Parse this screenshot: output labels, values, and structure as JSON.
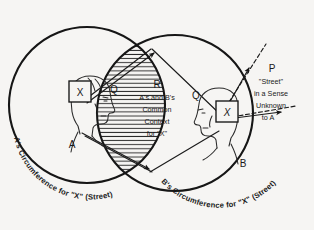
{
  "figure": {
    "background_color": "#f6f5f3",
    "ink_color": "#161616"
  },
  "circles": {
    "left": {
      "label": "A's Circumference for \"X\" (Street)",
      "owner": "A"
    },
    "right": {
      "label": "B's Circumference for \"X\" (Street)",
      "owner": "B"
    }
  },
  "regions": {
    "lens": {
      "marker": "R",
      "lines": [
        "A's and B's",
        "Common",
        "Context",
        "for \"X\""
      ],
      "hatched": true
    },
    "left_sector": {
      "marker": "Q"
    },
    "right_sector": {
      "marker": "Q"
    },
    "right_outer": {
      "marker": "P",
      "lines": [
        "\"Street\"",
        "in a Sense",
        "Unknown",
        "to A"
      ]
    }
  },
  "figures": {
    "person_a": {
      "label": "A",
      "head_symbol": "X",
      "facing": "right"
    },
    "person_b": {
      "label": "B",
      "head_symbol": "X",
      "head_symbol_style": "italic",
      "facing": "left"
    }
  },
  "icons": {
    "arrow_head": "arrow-head-icon",
    "hatching": "hatch-pattern-icon"
  }
}
